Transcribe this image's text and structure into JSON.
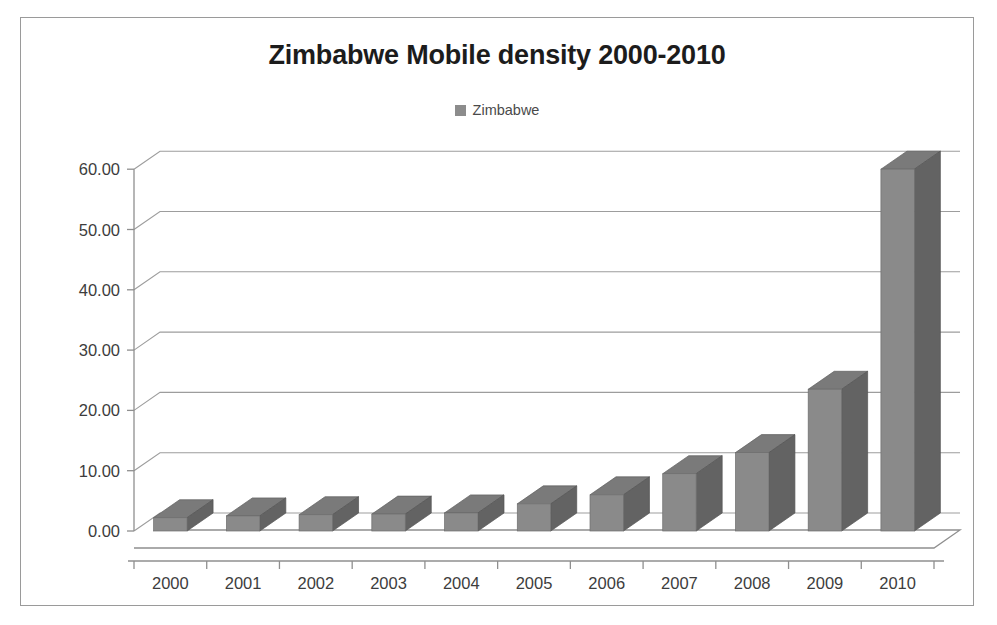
{
  "chart_data": {
    "type": "bar",
    "title": "Zimbabwe Mobile density 2000-2010",
    "xlabel": "",
    "ylabel": "",
    "categories": [
      "2000",
      "2001",
      "2002",
      "2003",
      "2004",
      "2005",
      "2006",
      "2007",
      "2008",
      "2009",
      "2010"
    ],
    "series": [
      {
        "name": "Zimbabwe",
        "values": [
          2.2,
          2.5,
          2.7,
          2.8,
          3.0,
          4.5,
          6.0,
          9.5,
          13.0,
          23.5,
          60.0
        ]
      }
    ],
    "ylim": [
      0,
      60
    ],
    "ytick_values": [
      0,
      10,
      20,
      30,
      40,
      50,
      60
    ],
    "ytick_labels": [
      "0.00",
      "10.00",
      "20.00",
      "30.00",
      "40.00",
      "50.00",
      "60.00"
    ],
    "grid": true,
    "legend_position": "top-center",
    "style": "3d-column",
    "colors": {
      "bar_front": "#8a8a8a",
      "bar_side": "#636363",
      "bar_top": "#7a7a7a",
      "grid": "#9d9d9d",
      "axis": "#8f8f8f",
      "text": "#3d3d3d",
      "title": "#1c1c1c",
      "frame": "#9a9a9a",
      "background": "#ffffff"
    }
  },
  "legend": {
    "entries": [
      {
        "label": "Zimbabwe",
        "color": "#8c8c8c",
        "marker": "square-marker"
      }
    ]
  },
  "title": "Zimbabwe Mobile density 2000-2010"
}
